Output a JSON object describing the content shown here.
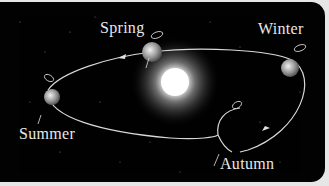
{
  "diagram": {
    "center": "sun",
    "labels": {
      "spring": "Spring",
      "winter": "Winter",
      "summer": "Summer",
      "autumn": "Autumn"
    },
    "colors": {
      "background": "#020202",
      "orbit": "#d8d8d8",
      "text": "#e8e8e8",
      "sun": "#ffffff"
    }
  }
}
